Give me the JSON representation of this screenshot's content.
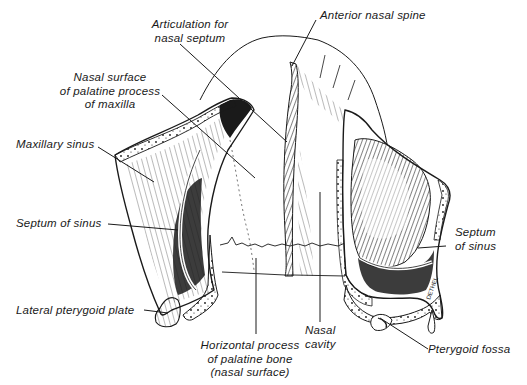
{
  "figure": {
    "ink_color": "#1a1a1a",
    "background": "#ffffff",
    "labels": {
      "articulation": [
        "Articulation for",
        "nasal septum"
      ],
      "anterior_spine": [
        "Anterior nasal spine"
      ],
      "nasal_surface": [
        "Nasal surface",
        "of palatine process",
        "of maxilla"
      ],
      "maxillary_sinus": [
        "Maxillary sinus"
      ],
      "septum_left": [
        "Septum of sinus"
      ],
      "septum_right": [
        "Septum",
        "of sinus"
      ],
      "lateral_pterygoid": [
        "Lateral pterygoid plate"
      ],
      "horizontal_process": [
        "Horizontal process",
        "of palatine bone",
        "(nasal surface)"
      ],
      "nasal_cavity": [
        "Nasal",
        "cavity"
      ],
      "pterygoid_fossa": [
        "Pterygoid fossa"
      ]
    },
    "signature": "DETHEL",
    "caption_partial": "...cavity and the maxillary sinus (cut off)"
  }
}
